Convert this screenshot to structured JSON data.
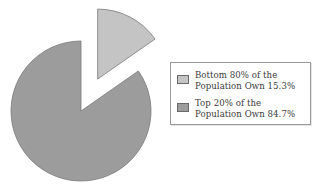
{
  "chart_data": {
    "type": "pie",
    "title": "",
    "categories": [
      "Bottom 80% of the Population",
      "Top 20% of the Population"
    ],
    "values": [
      15.3,
      84.7
    ],
    "unit": "%",
    "colors": [
      "#c4c4c4",
      "#9c9c9c"
    ],
    "exploded": [
      true,
      false
    ],
    "start_angle_deg_clockwise_from_top": 0,
    "legend": {
      "position": "right",
      "entries": [
        {
          "line1": "Bottom 80% of the",
          "line2": "Population Own 15.3%",
          "color": "#c4c4c4"
        },
        {
          "line1": "Top 20% of the",
          "line2": "Population Own 84.7%",
          "color": "#9c9c9c"
        }
      ]
    }
  },
  "colors": {
    "background": "#ffffff",
    "slice_outline": "#7a7a7a",
    "legend_border": "#9a9a9a",
    "text": "#3a3a3a"
  }
}
